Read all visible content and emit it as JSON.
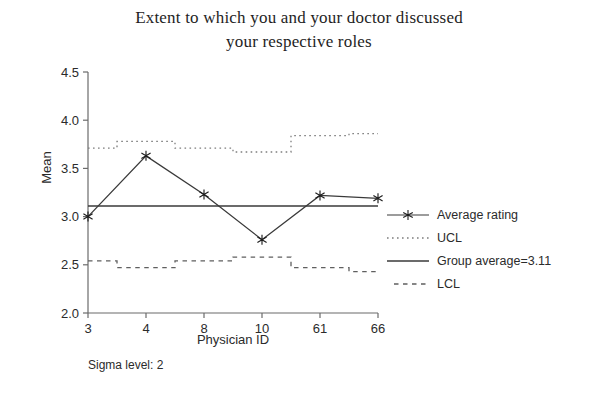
{
  "chart_data": {
    "type": "line",
    "title": "Extent to which you and your doctor discussed your respective roles",
    "title_line1": "Extent to which you and your doctor discussed",
    "title_line2": "your respective roles",
    "xlabel": "Physician ID",
    "ylabel": "Mean",
    "categories": [
      "3",
      "4",
      "8",
      "10",
      "61",
      "66"
    ],
    "ylim": [
      2.0,
      4.5
    ],
    "ytick_labels": [
      "2.0",
      "2.5",
      "3.0",
      "3.5",
      "4.0",
      "4.5"
    ],
    "ytick_values": [
      2.0,
      2.5,
      3.0,
      3.5,
      4.0,
      4.5
    ],
    "grid": false,
    "legend_position": "right",
    "series": [
      {
        "name": "Average rating",
        "style": "solid-with-star-markers",
        "values": [
          3.0,
          3.63,
          3.23,
          2.76,
          3.22,
          3.19
        ]
      },
      {
        "name": "UCL",
        "style": "dotted-step",
        "values": [
          3.71,
          3.78,
          3.71,
          3.67,
          3.84,
          3.86
        ]
      },
      {
        "name": "Group average=3.11",
        "style": "solid-constant",
        "value": 3.11
      },
      {
        "name": "LCL",
        "style": "dashed-step",
        "values": [
          2.54,
          2.47,
          2.54,
          2.58,
          2.47,
          2.43
        ]
      }
    ],
    "annotations": [
      {
        "name": "sigma-level",
        "text": "Sigma level: 2"
      }
    ],
    "colors": {
      "line": "#3a3a3a",
      "axis": "#6b6b6b",
      "text": "#2b2b2b",
      "background": "#ffffff"
    }
  },
  "legend": {
    "items": [
      {
        "label": "Average rating",
        "key": "line-star"
      },
      {
        "label": "UCL",
        "key": "dotted"
      },
      {
        "label": "Group average=3.11",
        "key": "solid"
      },
      {
        "label": "LCL",
        "key": "dashed"
      }
    ]
  }
}
